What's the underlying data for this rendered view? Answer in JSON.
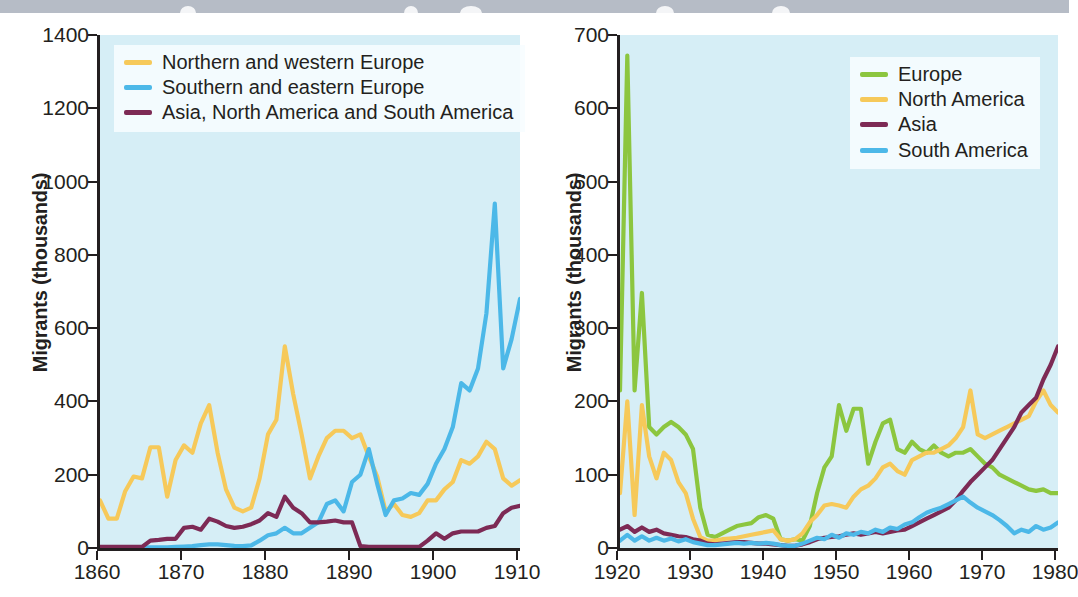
{
  "banner": {
    "name": "cropped-title-bar",
    "color": "#b6bcc6"
  },
  "page": {
    "background": "#ffffff",
    "plot_background": "#d6eef6",
    "axis_color": "#231f20"
  },
  "colors": {
    "yellow": "#f6c95a",
    "blue": "#4cb8e8",
    "purple": "#7d2a55",
    "green": "#8cc63f"
  },
  "chart_data": [
    {
      "id": "left-chart",
      "type": "line",
      "title": "",
      "xlabel": "",
      "ylabel": "Migrants (thousands)",
      "xlim": [
        1860,
        1910
      ],
      "ylim": [
        0,
        1400
      ],
      "xticks": [
        1860,
        1870,
        1880,
        1890,
        1900,
        1910
      ],
      "yticks": [
        0,
        200,
        400,
        600,
        800,
        1000,
        1200,
        1400
      ],
      "grid": false,
      "legend_position": "top-left",
      "series": [
        {
          "name": "Northern and western Europe",
          "color": "#f6c95a",
          "x": [
            1860,
            1861,
            1862,
            1863,
            1864,
            1865,
            1866,
            1867,
            1868,
            1869,
            1870,
            1871,
            1872,
            1873,
            1874,
            1875,
            1876,
            1877,
            1878,
            1879,
            1880,
            1881,
            1882,
            1883,
            1884,
            1885,
            1886,
            1887,
            1888,
            1889,
            1890,
            1891,
            1892,
            1893,
            1894,
            1895,
            1896,
            1897,
            1898,
            1899,
            1900,
            1901,
            1902,
            1903,
            1904,
            1905,
            1906,
            1907,
            1908,
            1909,
            1910
          ],
          "y": [
            130,
            80,
            80,
            155,
            195,
            190,
            275,
            275,
            140,
            240,
            280,
            260,
            340,
            390,
            260,
            160,
            110,
            100,
            110,
            190,
            310,
            350,
            550,
            420,
            310,
            190,
            250,
            300,
            320,
            320,
            300,
            310,
            250,
            195,
            100,
            120,
            90,
            85,
            95,
            130,
            130,
            160,
            180,
            240,
            230,
            250,
            290,
            270,
            190,
            170,
            185
          ]
        },
        {
          "name": "Southern and eastern Europe",
          "color": "#4cb8e8",
          "x": [
            1860,
            1861,
            1862,
            1863,
            1864,
            1865,
            1866,
            1867,
            1868,
            1869,
            1870,
            1871,
            1872,
            1873,
            1874,
            1875,
            1876,
            1877,
            1878,
            1879,
            1880,
            1881,
            1882,
            1883,
            1884,
            1885,
            1886,
            1887,
            1888,
            1889,
            1890,
            1891,
            1892,
            1893,
            1894,
            1895,
            1896,
            1897,
            1898,
            1899,
            1900,
            1901,
            1902,
            1903,
            1904,
            1905,
            1906,
            1907,
            1908,
            1909,
            1910
          ],
          "y": [
            2,
            2,
            2,
            2,
            2,
            2,
            2,
            2,
            2,
            3,
            4,
            5,
            8,
            10,
            10,
            8,
            6,
            5,
            7,
            20,
            35,
            40,
            55,
            40,
            40,
            55,
            70,
            120,
            130,
            100,
            180,
            200,
            270,
            175,
            90,
            130,
            135,
            150,
            145,
            175,
            230,
            270,
            330,
            450,
            430,
            490,
            640,
            940,
            490,
            570,
            680
          ]
        },
        {
          "name": "Asia, North America and South America",
          "color": "#7d2a55",
          "x": [
            1860,
            1861,
            1862,
            1863,
            1864,
            1865,
            1866,
            1867,
            1868,
            1869,
            1870,
            1871,
            1872,
            1873,
            1874,
            1875,
            1876,
            1877,
            1878,
            1879,
            1880,
            1881,
            1882,
            1883,
            1884,
            1885,
            1886,
            1887,
            1888,
            1889,
            1890,
            1891,
            1892,
            1893,
            1894,
            1895,
            1896,
            1897,
            1898,
            1899,
            1900,
            1901,
            1902,
            1903,
            1904,
            1905,
            1906,
            1907,
            1908,
            1909,
            1910
          ],
          "y": [
            3,
            3,
            3,
            3,
            3,
            3,
            20,
            22,
            25,
            25,
            55,
            58,
            50,
            80,
            72,
            60,
            55,
            58,
            65,
            75,
            95,
            85,
            140,
            110,
            95,
            70,
            70,
            72,
            75,
            70,
            70,
            5,
            3,
            3,
            3,
            3,
            3,
            3,
            3,
            20,
            40,
            25,
            40,
            45,
            45,
            45,
            55,
            60,
            95,
            110,
            115
          ]
        }
      ]
    },
    {
      "id": "right-chart",
      "type": "line",
      "title": "",
      "xlabel": "",
      "ylabel": "Migrants (thousands)",
      "xlim": [
        1920,
        1980
      ],
      "ylim": [
        0,
        700
      ],
      "xticks": [
        1920,
        1930,
        1940,
        1950,
        1960,
        1970,
        1980
      ],
      "yticks": [
        0,
        100,
        200,
        300,
        400,
        500,
        600,
        700
      ],
      "grid": false,
      "legend_position": "top-right",
      "series": [
        {
          "name": "Europe",
          "color": "#8cc63f",
          "x": [
            1920,
            1921,
            1922,
            1923,
            1924,
            1925,
            1926,
            1927,
            1928,
            1929,
            1930,
            1931,
            1932,
            1933,
            1934,
            1935,
            1936,
            1937,
            1938,
            1939,
            1940,
            1941,
            1942,
            1943,
            1944,
            1945,
            1946,
            1947,
            1948,
            1949,
            1950,
            1951,
            1952,
            1953,
            1954,
            1955,
            1956,
            1957,
            1958,
            1959,
            1960,
            1961,
            1962,
            1963,
            1964,
            1965,
            1966,
            1967,
            1968,
            1969,
            1970,
            1971,
            1972,
            1973,
            1974,
            1975,
            1976,
            1977,
            1978,
            1979,
            1980
          ],
          "y": [
            215,
            672,
            215,
            348,
            165,
            155,
            165,
            172,
            165,
            155,
            135,
            55,
            18,
            15,
            20,
            25,
            30,
            32,
            34,
            42,
            45,
            40,
            12,
            10,
            12,
            10,
            30,
            75,
            110,
            125,
            195,
            160,
            190,
            190,
            115,
            145,
            170,
            175,
            135,
            130,
            145,
            135,
            130,
            140,
            130,
            125,
            130,
            130,
            135,
            125,
            115,
            110,
            100,
            95,
            90,
            85,
            80,
            78,
            80,
            75,
            75
          ]
        },
        {
          "name": "North America",
          "color": "#f6c95a",
          "x": [
            1920,
            1921,
            1922,
            1923,
            1924,
            1925,
            1926,
            1927,
            1928,
            1929,
            1930,
            1931,
            1932,
            1933,
            1934,
            1935,
            1936,
            1937,
            1938,
            1939,
            1940,
            1941,
            1942,
            1943,
            1944,
            1945,
            1946,
            1947,
            1948,
            1949,
            1950,
            1951,
            1952,
            1953,
            1954,
            1955,
            1956,
            1957,
            1958,
            1959,
            1960,
            1961,
            1962,
            1963,
            1964,
            1965,
            1966,
            1967,
            1968,
            1969,
            1970,
            1971,
            1972,
            1973,
            1974,
            1975,
            1976,
            1977,
            1978,
            1979,
            1980
          ],
          "y": [
            75,
            200,
            45,
            195,
            125,
            95,
            130,
            120,
            90,
            75,
            40,
            15,
            10,
            10,
            12,
            13,
            14,
            16,
            18,
            20,
            22,
            24,
            12,
            10,
            12,
            20,
            35,
            45,
            58,
            60,
            58,
            55,
            70,
            80,
            85,
            95,
            110,
            115,
            105,
            100,
            120,
            125,
            130,
            130,
            135,
            140,
            150,
            165,
            215,
            155,
            150,
            155,
            160,
            165,
            170,
            175,
            180,
            200,
            215,
            195,
            185
          ]
        },
        {
          "name": "Asia",
          "color": "#7d2a55",
          "x": [
            1920,
            1921,
            1922,
            1923,
            1924,
            1925,
            1926,
            1927,
            1928,
            1929,
            1930,
            1931,
            1932,
            1933,
            1934,
            1935,
            1936,
            1937,
            1938,
            1939,
            1940,
            1941,
            1942,
            1943,
            1944,
            1945,
            1946,
            1947,
            1948,
            1949,
            1950,
            1951,
            1952,
            1953,
            1954,
            1955,
            1956,
            1957,
            1958,
            1959,
            1960,
            1961,
            1962,
            1963,
            1964,
            1965,
            1966,
            1967,
            1968,
            1969,
            1970,
            1971,
            1972,
            1973,
            1974,
            1975,
            1976,
            1977,
            1978,
            1979,
            1980
          ],
          "y": [
            25,
            30,
            22,
            28,
            22,
            25,
            20,
            18,
            16,
            15,
            12,
            10,
            6,
            5,
            6,
            7,
            8,
            8,
            7,
            6,
            6,
            5,
            4,
            3,
            3,
            5,
            8,
            12,
            14,
            15,
            16,
            18,
            20,
            18,
            20,
            22,
            20,
            22,
            24,
            25,
            30,
            35,
            40,
            45,
            50,
            55,
            65,
            78,
            90,
            100,
            110,
            120,
            135,
            150,
            165,
            185,
            195,
            205,
            230,
            250,
            275
          ]
        },
        {
          "name": "South America",
          "color": "#4cb8e8",
          "x": [
            1920,
            1921,
            1922,
            1923,
            1924,
            1925,
            1926,
            1927,
            1928,
            1929,
            1930,
            1931,
            1932,
            1933,
            1934,
            1935,
            1936,
            1937,
            1938,
            1939,
            1940,
            1941,
            1942,
            1943,
            1944,
            1945,
            1946,
            1947,
            1948,
            1949,
            1950,
            1951,
            1952,
            1953,
            1954,
            1955,
            1956,
            1957,
            1958,
            1959,
            1960,
            1961,
            1962,
            1963,
            1964,
            1965,
            1966,
            1967,
            1968,
            1969,
            1970,
            1971,
            1972,
            1973,
            1974,
            1975,
            1976,
            1977,
            1978,
            1979,
            1980
          ],
          "y": [
            10,
            18,
            10,
            16,
            10,
            14,
            10,
            13,
            9,
            12,
            8,
            6,
            4,
            4,
            5,
            6,
            7,
            6,
            7,
            6,
            7,
            6,
            4,
            3,
            3,
            6,
            10,
            14,
            12,
            18,
            14,
            20,
            18,
            22,
            20,
            25,
            22,
            28,
            26,
            32,
            35,
            42,
            48,
            52,
            55,
            60,
            65,
            70,
            62,
            55,
            50,
            45,
            38,
            30,
            20,
            25,
            22,
            30,
            25,
            28,
            35
          ]
        }
      ]
    }
  ],
  "left": {
    "ylabel": "Migrants (thousands)",
    "yticks": [
      "0",
      "200",
      "400",
      "600",
      "800",
      "1000",
      "1200",
      "1400"
    ],
    "xticks": [
      "1860",
      "1870",
      "1880",
      "1890",
      "1900",
      "1910"
    ],
    "legend": [
      {
        "label": "Northern and western Europe",
        "color": "#f6c95a"
      },
      {
        "label": "Southern and eastern Europe",
        "color": "#4cb8e8"
      },
      {
        "label": "Asia, North America and South America",
        "color": "#7d2a55"
      }
    ]
  },
  "right": {
    "ylabel": "Migrants (thousands)",
    "yticks": [
      "0",
      "100",
      "200",
      "300",
      "400",
      "500",
      "600",
      "700"
    ],
    "xticks": [
      "1920",
      "1930",
      "1940",
      "1950",
      "1960",
      "1970",
      "1980"
    ],
    "legend": [
      {
        "label": "Europe",
        "color": "#8cc63f"
      },
      {
        "label": "North America",
        "color": "#f6c95a"
      },
      {
        "label": "Asia",
        "color": "#7d2a55"
      },
      {
        "label": "South America",
        "color": "#4cb8e8"
      }
    ]
  }
}
